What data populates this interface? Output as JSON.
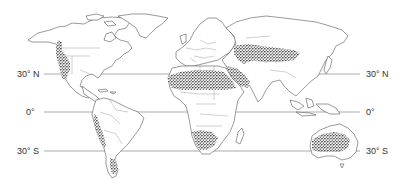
{
  "map": {
    "title": "World deserts map",
    "latitude_lines": [
      {
        "id": "n30",
        "label_left": "30° N",
        "label_right": "30° N",
        "y": 74
      },
      {
        "id": "eq",
        "label_left": "0°",
        "label_right": "0°",
        "y": 112
      },
      {
        "id": "s30",
        "label_left": "30° S",
        "label_right": "30° S",
        "y": 151
      }
    ],
    "shaded_regions": [
      "Great Basin / Mojave / Sonoran Desert",
      "Sahara Desert",
      "Arabian Desert",
      "Central Asian / Gobi Deserts",
      "Atacama Desert",
      "Patagonian Desert",
      "Kalahari / Namib Desert",
      "Australian Desert"
    ],
    "colors": {
      "land_fill": "#ffffff",
      "outline": "#555555",
      "desert_stipple": "#222222",
      "latitude_line": "#888888"
    }
  }
}
